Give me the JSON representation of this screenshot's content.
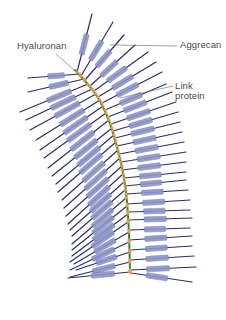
{
  "labels": {
    "hyaluronan": "Hyaluronan",
    "aggrecan": "Aggrecan",
    "link_line1": "Link",
    "link_line2": "protein"
  },
  "colors": {
    "background": "#ffffff",
    "backbone": "#2f8a2a",
    "branch_line": "#2b2f6b",
    "core_box": "#8c95c8",
    "core_box_stroke": "#6f78b4",
    "link_protein": "#e69a4a",
    "leader_line": "#7a7a7a",
    "label_text": "#4a4a4a"
  },
  "backbone": {
    "points": [
      [
        75,
        70
      ],
      [
        88,
        84
      ],
      [
        100,
        100
      ],
      [
        110,
        122
      ],
      [
        118,
        150
      ],
      [
        124,
        176
      ],
      [
        127,
        200
      ],
      [
        129,
        230
      ],
      [
        130,
        272
      ]
    ]
  },
  "branches": {
    "left": [
      {
        "at": [
          80,
          74
        ],
        "end": [
          28,
          78
        ],
        "box": [
          0.3,
          0.62
        ]
      },
      {
        "at": [
          84,
          79
        ],
        "end": [
          28,
          92
        ],
        "box": [
          0.28,
          0.62
        ]
      },
      {
        "at": [
          88,
          84
        ],
        "end": [
          20,
          112
        ],
        "box": [
          0.25,
          0.6
        ]
      },
      {
        "at": [
          92,
          89
        ],
        "end": [
          26,
          120
        ],
        "box": [
          0.25,
          0.62
        ]
      },
      {
        "at": [
          96,
          94
        ],
        "end": [
          30,
          130
        ],
        "box": [
          0.25,
          0.62
        ]
      },
      {
        "at": [
          100,
          100
        ],
        "end": [
          36,
          140
        ],
        "box": [
          0.25,
          0.62
        ]
      },
      {
        "at": [
          103,
          106
        ],
        "end": [
          40,
          150
        ],
        "box": [
          0.25,
          0.62
        ]
      },
      {
        "at": [
          106,
          113
        ],
        "end": [
          44,
          158
        ],
        "box": [
          0.25,
          0.62
        ]
      },
      {
        "at": [
          109,
          120
        ],
        "end": [
          48,
          168
        ],
        "box": [
          0.25,
          0.62
        ]
      },
      {
        "at": [
          112,
          128
        ],
        "end": [
          52,
          176
        ],
        "box": [
          0.25,
          0.62
        ]
      },
      {
        "at": [
          114,
          135
        ],
        "end": [
          56,
          184
        ],
        "box": [
          0.25,
          0.62
        ]
      },
      {
        "at": [
          116,
          142
        ],
        "end": [
          58,
          192
        ],
        "box": [
          0.25,
          0.62
        ]
      },
      {
        "at": [
          118,
          150
        ],
        "end": [
          62,
          200
        ],
        "box": [
          0.25,
          0.62
        ]
      },
      {
        "at": [
          120,
          158
        ],
        "end": [
          64,
          208
        ],
        "box": [
          0.25,
          0.62
        ]
      },
      {
        "at": [
          122,
          166
        ],
        "end": [
          66,
          216
        ],
        "box": [
          0.25,
          0.62
        ]
      },
      {
        "at": [
          123,
          174
        ],
        "end": [
          68,
          224
        ],
        "box": [
          0.25,
          0.62
        ]
      },
      {
        "at": [
          124,
          182
        ],
        "end": [
          70,
          230
        ],
        "box": [
          0.25,
          0.62
        ]
      },
      {
        "at": [
          125,
          190
        ],
        "end": [
          72,
          236
        ],
        "box": [
          0.25,
          0.62
        ]
      },
      {
        "at": [
          126,
          198
        ],
        "end": [
          72,
          244
        ],
        "box": [
          0.25,
          0.62
        ]
      },
      {
        "at": [
          127,
          206
        ],
        "end": [
          72,
          250
        ],
        "box": [
          0.25,
          0.62
        ]
      },
      {
        "at": [
          128,
          214
        ],
        "end": [
          72,
          256
        ],
        "box": [
          0.25,
          0.62
        ]
      },
      {
        "at": [
          128,
          222
        ],
        "end": [
          70,
          262
        ],
        "box": [
          0.25,
          0.62
        ]
      },
      {
        "at": [
          129,
          232
        ],
        "end": [
          74,
          264
        ],
        "box": [
          0.25,
          0.62
        ]
      },
      {
        "at": [
          129,
          242
        ],
        "end": [
          70,
          270
        ],
        "box": [
          0.25,
          0.62
        ]
      },
      {
        "at": [
          130,
          252
        ],
        "end": [
          76,
          270
        ],
        "box": [
          0.25,
          0.62
        ]
      },
      {
        "at": [
          130,
          262
        ],
        "end": [
          70,
          277
        ],
        "box": [
          0.25,
          0.62
        ]
      },
      {
        "at": [
          130,
          272
        ],
        "end": [
          68,
          278
        ],
        "box": [
          0.25,
          0.62
        ]
      }
    ],
    "right": [
      {
        "at": [
          77,
          72
        ],
        "end": [
          92,
          14
        ],
        "box": [
          0.3,
          0.65
        ]
      },
      {
        "at": [
          81,
          76
        ],
        "end": [
          113,
          22
        ],
        "box": [
          0.3,
          0.65
        ]
      },
      {
        "at": [
          85,
          80
        ],
        "end": [
          124,
          35
        ],
        "box": [
          0.3,
          0.65
        ]
      },
      {
        "at": [
          90,
          86
        ],
        "end": [
          135,
          45
        ],
        "box": [
          0.25,
          0.6
        ]
      },
      {
        "at": [
          94,
          91
        ],
        "end": [
          148,
          52
        ],
        "box": [
          0.25,
          0.6
        ]
      },
      {
        "at": [
          98,
          97
        ],
        "end": [
          156,
          62
        ],
        "box": [
          0.25,
          0.6
        ]
      },
      {
        "at": [
          102,
          103
        ],
        "end": [
          162,
          72
        ],
        "box": [
          0.25,
          0.6
        ]
      },
      {
        "at": [
          105,
          110
        ],
        "end": [
          166,
          84
        ],
        "box": [
          0.25,
          0.6
        ]
      },
      {
        "at": [
          108,
          117
        ],
        "end": [
          172,
          92
        ],
        "box": [
          0.25,
          0.6
        ]
      },
      {
        "at": [
          111,
          124
        ],
        "end": [
          176,
          102
        ],
        "box": [
          0.25,
          0.6
        ]
      },
      {
        "at": [
          113,
          131
        ],
        "end": [
          178,
          112
        ],
        "box": [
          0.25,
          0.6
        ]
      },
      {
        "at": [
          115,
          138
        ],
        "end": [
          180,
          122
        ],
        "box": [
          0.25,
          0.6
        ]
      },
      {
        "at": [
          117,
          146
        ],
        "end": [
          182,
          132
        ],
        "box": [
          0.25,
          0.6
        ]
      },
      {
        "at": [
          119,
          154
        ],
        "end": [
          184,
          142
        ],
        "box": [
          0.25,
          0.6
        ]
      },
      {
        "at": [
          121,
          162
        ],
        "end": [
          186,
          152
        ],
        "box": [
          0.25,
          0.6
        ]
      },
      {
        "at": [
          122,
          170
        ],
        "end": [
          186,
          162
        ],
        "box": [
          0.25,
          0.6
        ]
      },
      {
        "at": [
          124,
          178
        ],
        "end": [
          186,
          172
        ],
        "box": [
          0.25,
          0.6
        ]
      },
      {
        "at": [
          125,
          186
        ],
        "end": [
          186,
          180
        ],
        "box": [
          0.25,
          0.6
        ]
      },
      {
        "at": [
          126,
          194
        ],
        "end": [
          188,
          190
        ],
        "box": [
          0.25,
          0.6
        ]
      },
      {
        "at": [
          127,
          204
        ],
        "end": [
          190,
          200
        ],
        "box": [
          0.25,
          0.6
        ]
      },
      {
        "at": [
          128,
          212
        ],
        "end": [
          190,
          210
        ],
        "box": [
          0.25,
          0.6
        ]
      },
      {
        "at": [
          128,
          220
        ],
        "end": [
          192,
          218
        ],
        "box": [
          0.25,
          0.6
        ]
      },
      {
        "at": [
          129,
          230
        ],
        "end": [
          190,
          228
        ],
        "box": [
          0.25,
          0.6
        ]
      },
      {
        "at": [
          129,
          240
        ],
        "end": [
          192,
          236
        ],
        "box": [
          0.25,
          0.6
        ]
      },
      {
        "at": [
          130,
          250
        ],
        "end": [
          192,
          246
        ],
        "box": [
          0.25,
          0.6
        ]
      },
      {
        "at": [
          130,
          260
        ],
        "end": [
          194,
          256
        ],
        "box": [
          0.25,
          0.6
        ]
      },
      {
        "at": [
          130,
          270
        ],
        "end": [
          196,
          267
        ],
        "box": [
          0.25,
          0.6
        ]
      },
      {
        "at": [
          131,
          273
        ],
        "end": [
          192,
          282
        ],
        "box": [
          0.25,
          0.6
        ]
      }
    ]
  },
  "leaders": {
    "hyaluronan": {
      "from": [
        56,
        54
      ],
      "to": [
        74,
        70
      ]
    },
    "aggrecan": {
      "from": [
        177,
        46
      ],
      "to": [
        110,
        45
      ]
    },
    "link": {
      "from": [
        173,
        86
      ],
      "to": [
        120,
        98
      ]
    }
  }
}
